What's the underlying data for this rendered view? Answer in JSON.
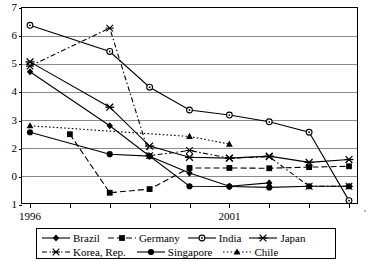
{
  "chart_data": {
    "type": "line",
    "title": "",
    "xlabel": "",
    "ylabel": "",
    "x": [
      "1996",
      "1997",
      "1998",
      "1999",
      "2000",
      "2001",
      "2002",
      "2003",
      "2004"
    ],
    "tick_labels": [
      "1996",
      "",
      "",
      "",
      "",
      "2001",
      "",
      "",
      ""
    ],
    "ylim": [
      0,
      7
    ],
    "y_ticks": [
      7,
      6,
      5,
      4,
      3,
      2,
      1,
      0
    ],
    "y_tick_labels": [
      "7",
      "6",
      "5",
      "4",
      "3",
      "2",
      "0",
      "1"
    ],
    "grid": true,
    "legend_position": "bottom",
    "series": [
      {
        "name": "Brazil",
        "marker": "filled-diamond",
        "line": "solid",
        "values": [
          4.7,
          null,
          2.78,
          1.7,
          1.1,
          0.63,
          0.75,
          null,
          null
        ]
      },
      {
        "name": "Germany",
        "marker": "filled-square",
        "line": "dashed",
        "values": [
          null,
          2.48,
          0.4,
          0.53,
          1.28,
          1.28,
          1.27,
          1.31,
          1.34
        ]
      },
      {
        "name": "India",
        "marker": "open-circle",
        "line": "solid",
        "values": [
          6.35,
          null,
          5.42,
          4.15,
          3.34,
          3.16,
          2.92,
          2.55,
          0.12
        ]
      },
      {
        "name": "Japan",
        "marker": "x-cross",
        "line": "solid",
        "values": [
          5.05,
          null,
          3.44,
          2.06,
          1.66,
          1.63,
          1.7,
          1.48,
          1.58
        ]
      },
      {
        "name": "Korea, Rep.",
        "marker": "asterisk",
        "line": "dash-dot",
        "values": [
          4.9,
          null,
          6.25,
          1.72,
          1.9,
          1.63,
          1.68,
          0.63,
          0.63
        ]
      },
      {
        "name": "Singapore",
        "marker": "filled-circle",
        "line": "solid",
        "values": [
          2.55,
          null,
          1.77,
          1.7,
          0.63,
          0.62,
          0.59,
          0.63,
          0.63
        ]
      },
      {
        "name": "Chile",
        "marker": "filled-triangle",
        "line": "dotted",
        "values": [
          2.78,
          null,
          null,
          null,
          2.4,
          2.13,
          null,
          null,
          null
        ]
      }
    ]
  },
  "legend": {
    "rows": [
      [
        {
          "label": "Brazil",
          "marker": "filled-diamond",
          "line": "solid"
        },
        {
          "label": "Germany",
          "marker": "filled-square",
          "line": "dashed"
        },
        {
          "label": "India",
          "marker": "open-circle",
          "line": "solid"
        },
        {
          "label": "Japan",
          "marker": "x-cross",
          "line": "solid"
        }
      ],
      [
        {
          "label": "Korea, Rep.",
          "marker": "asterisk",
          "line": "dash-dot"
        },
        {
          "label": "Singapore",
          "marker": "filled-circle",
          "line": "solid"
        },
        {
          "label": "Chile",
          "marker": "filled-triangle",
          "line": "dotted"
        }
      ]
    ]
  },
  "colors": {
    "line": "#000000",
    "grid": "#8a8a8a",
    "axis": "#000000",
    "background": "#ffffff"
  }
}
